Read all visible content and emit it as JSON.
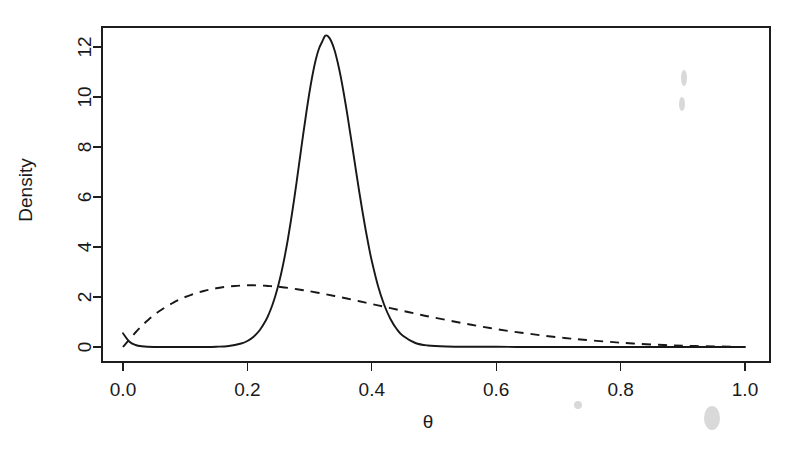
{
  "figure": {
    "background_color": "#ffffff",
    "ink_color": "#181818",
    "box": {
      "left": 102,
      "top": 27,
      "right": 770,
      "bottom": 362
    }
  },
  "chart_data": {
    "type": "line",
    "title": "",
    "subtitle": "",
    "xlabel": "θ",
    "ylabel": "Density",
    "xlim": [
      -0.035,
      1.04
    ],
    "ylim": [
      -0.22,
      13.4
    ],
    "grid": false,
    "legend": null,
    "legend_position": "none",
    "x_ticks": [
      0.0,
      0.2,
      0.4,
      0.6,
      0.8,
      1.0
    ],
    "x_ticklabels": [
      "0.0",
      "0.2",
      "0.4",
      "0.6",
      "0.8",
      "1.0"
    ],
    "y_ticks": [
      0,
      2,
      4,
      6,
      8,
      10,
      12
    ],
    "y_ticklabels": [
      "0",
      "2",
      "4",
      "6",
      "8",
      "10",
      "12"
    ],
    "series": [
      {
        "name": "posterior",
        "style": "solid",
        "peak_x": 0.315,
        "peak_y": 12.45,
        "x": [
          0.0,
          0.01,
          0.02,
          0.03,
          0.05,
          0.07,
          0.09,
          0.11,
          0.13,
          0.15,
          0.17,
          0.19,
          0.2,
          0.21,
          0.22,
          0.23,
          0.235,
          0.24,
          0.245,
          0.25,
          0.255,
          0.26,
          0.265,
          0.27,
          0.275,
          0.28,
          0.285,
          0.29,
          0.295,
          0.3,
          0.305,
          0.31,
          0.315,
          0.32,
          0.325,
          0.33,
          0.335,
          0.34,
          0.345,
          0.35,
          0.355,
          0.36,
          0.365,
          0.37,
          0.375,
          0.38,
          0.385,
          0.39,
          0.395,
          0.4,
          0.41,
          0.42,
          0.43,
          0.44,
          0.45,
          0.47,
          0.49,
          0.52,
          0.56,
          0.6,
          0.65,
          0.7,
          0.75,
          0.8,
          0.85,
          0.9,
          0.95,
          1.0
        ],
        "y": [
          0.55,
          0.22,
          0.08,
          0.03,
          0.0,
          0.0,
          0.0,
          0.0,
          0.0,
          0.01,
          0.04,
          0.14,
          0.24,
          0.41,
          0.68,
          1.08,
          1.35,
          1.67,
          2.05,
          2.5,
          3.02,
          3.62,
          4.3,
          5.06,
          5.88,
          6.76,
          7.66,
          8.56,
          9.42,
          10.22,
          10.92,
          11.5,
          11.93,
          12.2,
          12.45,
          12.42,
          12.22,
          11.88,
          11.4,
          10.82,
          10.14,
          9.4,
          8.6,
          7.8,
          6.98,
          6.18,
          5.42,
          4.7,
          4.04,
          3.44,
          2.44,
          1.68,
          1.12,
          0.72,
          0.45,
          0.16,
          0.06,
          0.02,
          0.01,
          0.01,
          0.0,
          0.0,
          0.0,
          0.0,
          0.0,
          0.0,
          0.0,
          0.0
        ]
      },
      {
        "name": "prior",
        "style": "dashed",
        "peak_x": 0.205,
        "peak_y": 2.47,
        "x": [
          0.0,
          0.01,
          0.02,
          0.03,
          0.04,
          0.05,
          0.06,
          0.07,
          0.08,
          0.09,
          0.1,
          0.11,
          0.12,
          0.13,
          0.14,
          0.15,
          0.16,
          0.17,
          0.18,
          0.19,
          0.2,
          0.21,
          0.22,
          0.23,
          0.24,
          0.25,
          0.26,
          0.27,
          0.28,
          0.29,
          0.3,
          0.32,
          0.34,
          0.36,
          0.38,
          0.4,
          0.42,
          0.44,
          0.46,
          0.48,
          0.5,
          0.53,
          0.56,
          0.59,
          0.62,
          0.65,
          0.68,
          0.71,
          0.74,
          0.78,
          0.82,
          0.87,
          0.92,
          1.0
        ],
        "y": [
          0.0,
          0.3,
          0.58,
          0.84,
          1.07,
          1.28,
          1.46,
          1.62,
          1.76,
          1.89,
          2.0,
          2.09,
          2.17,
          2.24,
          2.3,
          2.35,
          2.39,
          2.42,
          2.44,
          2.46,
          2.47,
          2.47,
          2.46,
          2.45,
          2.43,
          2.41,
          2.38,
          2.35,
          2.31,
          2.27,
          2.23,
          2.14,
          2.04,
          1.94,
          1.83,
          1.72,
          1.61,
          1.5,
          1.39,
          1.28,
          1.18,
          1.03,
          0.89,
          0.76,
          0.64,
          0.54,
          0.44,
          0.36,
          0.29,
          0.21,
          0.14,
          0.08,
          0.04,
          0.0
        ]
      }
    ]
  }
}
